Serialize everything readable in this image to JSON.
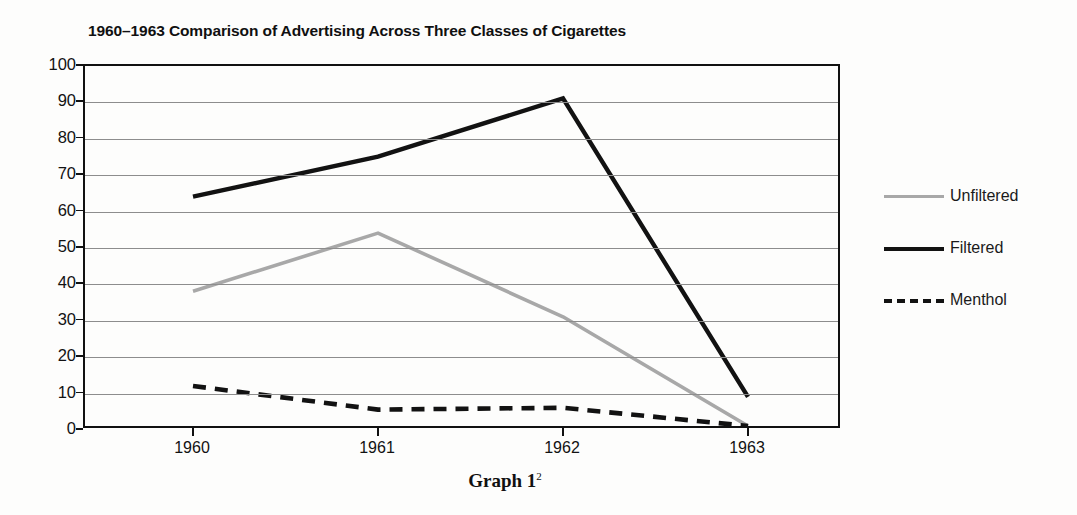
{
  "chart_data": {
    "type": "line",
    "title": "1960–1963 Comparison of Advertising Across Three Classes of Cigarettes",
    "xlabel": "",
    "ylabel": "",
    "categories": [
      "1960",
      "1961",
      "1962",
      "1963"
    ],
    "ylim": [
      0,
      100
    ],
    "yticks": [
      "100",
      "90",
      "80",
      "70",
      "60",
      "50",
      "40",
      "30",
      "20",
      "10",
      "0"
    ],
    "grid": true,
    "legend_position": "right",
    "series": [
      {
        "name": "Unfiltered",
        "values": [
          37,
          53,
          30,
          0
        ],
        "color": "#a8a8a8",
        "style": "solid"
      },
      {
        "name": "Filtered",
        "values": [
          63,
          74,
          90,
          8
        ],
        "color": "#121212",
        "style": "solid"
      },
      {
        "name": "Menthol",
        "values": [
          11,
          4.5,
          5,
          0
        ],
        "color": "#121212",
        "style": "dashed"
      }
    ]
  },
  "caption": {
    "text": "Graph 1",
    "footnote_marker": "2"
  }
}
